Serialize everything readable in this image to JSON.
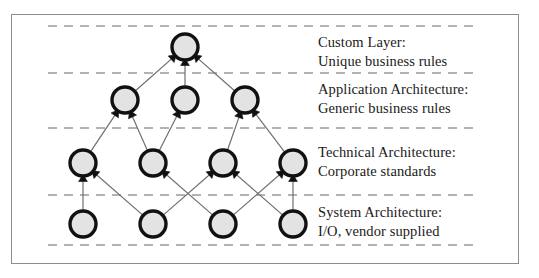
{
  "figure": {
    "border_color": "#8d8d8d",
    "background": "#ffffff"
  },
  "style": {
    "node_fill": "#e3e3e3",
    "node_stroke": "#111111",
    "node_stroke_width": 3.4,
    "node_radius": 13,
    "edge_color": "#6f6f6f",
    "edge_width": 1.2,
    "arrow_color": "#111111",
    "divider_color": "#9a9a9a",
    "text_color": "#1a1a1a"
  },
  "dividers": [
    {
      "name": "divider-top",
      "y": 26,
      "x1": 48,
      "x2": 478
    },
    {
      "name": "divider-custom-application",
      "y": 73,
      "x1": 48,
      "x2": 478
    },
    {
      "name": "divider-application-technical",
      "y": 128,
      "x1": 48,
      "x2": 478
    },
    {
      "name": "divider-technical-system",
      "y": 195,
      "x1": 48,
      "x2": 478
    },
    {
      "name": "divider-bottom",
      "y": 245,
      "x1": 48,
      "x2": 478
    }
  ],
  "layers": [
    {
      "id": "custom",
      "title": "Custom Layer:",
      "subtitle": "Unique business rules",
      "label_x": 318,
      "label_y": 33,
      "nodes": [
        {
          "id": "custom-1",
          "cx": 185,
          "cy": 47
        }
      ]
    },
    {
      "id": "application",
      "title": "Application Architecture:",
      "subtitle": "Generic business rules",
      "label_x": 318,
      "label_y": 80,
      "nodes": [
        {
          "id": "application-1",
          "cx": 125,
          "cy": 100
        },
        {
          "id": "application-2",
          "cx": 185,
          "cy": 100
        },
        {
          "id": "application-3",
          "cx": 245,
          "cy": 100
        }
      ]
    },
    {
      "id": "technical",
      "title": "Technical Architecture:",
      "subtitle": "Corporate standards",
      "label_x": 318,
      "label_y": 143,
      "nodes": [
        {
          "id": "technical-1",
          "cx": 83,
          "cy": 163
        },
        {
          "id": "technical-2",
          "cx": 153,
          "cy": 163
        },
        {
          "id": "technical-3",
          "cx": 223,
          "cy": 163
        },
        {
          "id": "technical-4",
          "cx": 293,
          "cy": 163
        }
      ]
    },
    {
      "id": "system",
      "title": "System Architecture:",
      "subtitle": "I/O, vendor supplied",
      "label_x": 318,
      "label_y": 203,
      "nodes": [
        {
          "id": "system-1",
          "cx": 83,
          "cy": 224
        },
        {
          "id": "system-2",
          "cx": 153,
          "cy": 224
        },
        {
          "id": "system-3",
          "cx": 223,
          "cy": 224
        },
        {
          "id": "system-4",
          "cx": 293,
          "cy": 224
        }
      ]
    }
  ],
  "edges": [
    {
      "from": "system-1",
      "to": "technical-1"
    },
    {
      "from": "system-2",
      "to": "technical-1"
    },
    {
      "from": "system-2",
      "to": "technical-3"
    },
    {
      "from": "system-3",
      "to": "technical-2"
    },
    {
      "from": "system-3",
      "to": "technical-4"
    },
    {
      "from": "system-4",
      "to": "technical-3"
    },
    {
      "from": "system-4",
      "to": "technical-4"
    },
    {
      "from": "technical-1",
      "to": "application-1"
    },
    {
      "from": "technical-2",
      "to": "application-1"
    },
    {
      "from": "technical-2",
      "to": "application-2"
    },
    {
      "from": "technical-3",
      "to": "application-3"
    },
    {
      "from": "technical-4",
      "to": "application-3"
    },
    {
      "from": "application-1",
      "to": "custom-1"
    },
    {
      "from": "application-2",
      "to": "custom-1"
    },
    {
      "from": "application-3",
      "to": "custom-1"
    }
  ]
}
